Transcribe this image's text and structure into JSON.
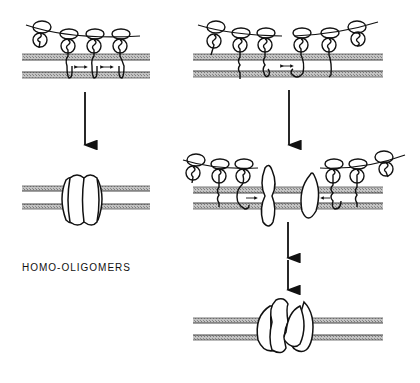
{
  "diagram": {
    "left_panel": {
      "label": "HOMO-OLIGOMERS",
      "stages": [
        "monomers-in-membrane",
        "homo-oligomer"
      ],
      "monomer_count": 4
    },
    "right_panel": {
      "stages": [
        "monomers-in-membrane",
        "intermediate-assembly",
        "hetero-oligomer"
      ],
      "monomer_count": 6
    },
    "colors": {
      "line": "#111111",
      "membrane": "#a8a8a8",
      "background": "#ffffff"
    }
  }
}
